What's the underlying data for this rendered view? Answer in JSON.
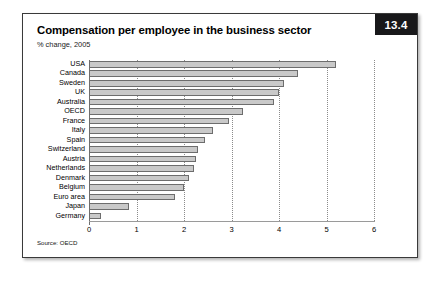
{
  "figure": {
    "number_badge": "13.4",
    "title": "Compensation per employee in the business sector",
    "subtitle": "% change, 2005",
    "source": "Source: OECD"
  },
  "chart_data": {
    "type": "bar",
    "orientation": "horizontal",
    "title": "Compensation per employee in the business sector",
    "subtitle": "% change, 2005",
    "xlabel": "",
    "ylabel": "",
    "xlim": [
      0,
      6
    ],
    "xticks": [
      "0",
      "1",
      "2",
      "3",
      "4",
      "5",
      "6"
    ],
    "grid": "vertical-dotted",
    "legend": "none",
    "bar_color": "#c9c9c9",
    "bar_border_color": "#6d6d6d",
    "categories": [
      "USA",
      "Canada",
      "Sweden",
      "UK",
      "Australia",
      "OECD",
      "France",
      "Italy",
      "Spain",
      "Switzerland",
      "Austria",
      "Netherlands",
      "Denmark",
      "Belgium",
      "Euro area",
      "Japan",
      "Germany"
    ],
    "values": [
      5.2,
      4.4,
      4.1,
      4.0,
      3.9,
      3.25,
      2.95,
      2.6,
      2.45,
      2.3,
      2.25,
      2.2,
      2.1,
      2.0,
      1.8,
      0.85,
      0.25
    ]
  }
}
